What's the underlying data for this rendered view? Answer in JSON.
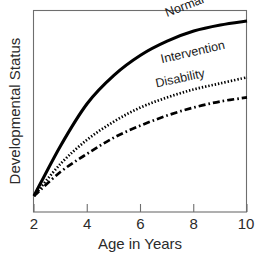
{
  "chart_data": {
    "type": "line",
    "title": "",
    "xlabel": "Age in Years",
    "ylabel": "Developmental Status",
    "xlim": [
      2,
      10
    ],
    "ylim": [
      0,
      100
    ],
    "grid": false,
    "legend_position": "inline-curve-labels",
    "xticks": [
      "2",
      "4",
      "6",
      "8",
      "10"
    ],
    "xtick_values": [
      2,
      4,
      6,
      8,
      10
    ],
    "yticks": [],
    "x": [
      2,
      3,
      4,
      5,
      6,
      7,
      8,
      9,
      10
    ],
    "series": [
      {
        "name": "Normal",
        "style": "solid",
        "values": [
          8,
          33,
          54,
          68,
          78,
          85,
          90,
          93,
          95
        ]
      },
      {
        "name": "Intervention",
        "style": "dotted",
        "values": [
          8,
          24,
          36,
          45,
          52,
          57,
          61,
          64,
          67
        ]
      },
      {
        "name": "Disability",
        "style": "dash-dot",
        "values": [
          8,
          20,
          29,
          37,
          43,
          48,
          52,
          55,
          57
        ]
      }
    ],
    "annotations": [
      {
        "text": "Normal",
        "x": 7.0,
        "y": 97,
        "rotation": -21
      },
      {
        "text": "Intervention",
        "x": 6.8,
        "y": 74,
        "rotation": -13
      },
      {
        "text": "Disability",
        "x": 6.6,
        "y": 62,
        "rotation": -12
      }
    ],
    "colors": {
      "curve": "#000000",
      "frame": "#6e6e6e",
      "text": "#2b2b2b",
      "background": "#ffffff"
    }
  }
}
